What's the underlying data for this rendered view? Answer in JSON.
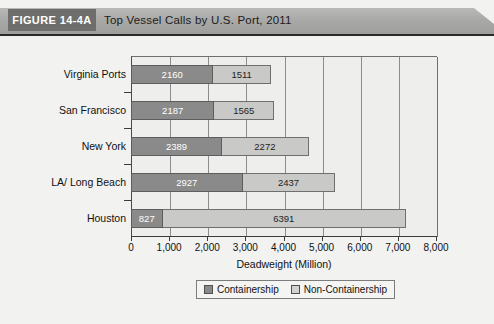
{
  "header": {
    "figure_tag": "FIGURE 14-4A",
    "title": "Top Vessel Calls by U.S. Port, 2011",
    "tag_bg": "#6e6e6c",
    "bar_bg": "#a9a9a7"
  },
  "chart_data": {
    "type": "bar",
    "orientation": "horizontal",
    "stacked": true,
    "title": "Top Vessel Calls by U.S. Port, 2011",
    "xlabel": "Deadweight (Million)",
    "ylabel": "",
    "categories": [
      "Virginia Ports",
      "San Francisco",
      "New York",
      "LA/ Long Beach",
      "Houston"
    ],
    "series": [
      {
        "name": "Containership",
        "color": "#8a8a8a",
        "values": [
          2160,
          2187,
          2389,
          2927,
          827
        ]
      },
      {
        "name": "Non-Containership",
        "color": "#c9c9c7",
        "values": [
          1511,
          1565,
          2272,
          2437,
          6391
        ]
      }
    ],
    "totals": [
      3671,
      3752,
      4661,
      5364,
      7218
    ],
    "xlim": [
      0,
      8000
    ],
    "xticks": [
      0,
      1000,
      2000,
      3000,
      4000,
      5000,
      6000,
      7000,
      8000
    ],
    "xtick_labels": [
      "0",
      "1,000",
      "2,000",
      "3,000",
      "4,000",
      "5,000",
      "6,000",
      "7,000",
      "8,000"
    ],
    "grid": "vertical",
    "legend_position": "bottom"
  },
  "legend": {
    "items": [
      {
        "label": "Containership",
        "color": "#8a8a8a"
      },
      {
        "label": "Non-Containership",
        "color": "#d2d2d0"
      }
    ]
  }
}
